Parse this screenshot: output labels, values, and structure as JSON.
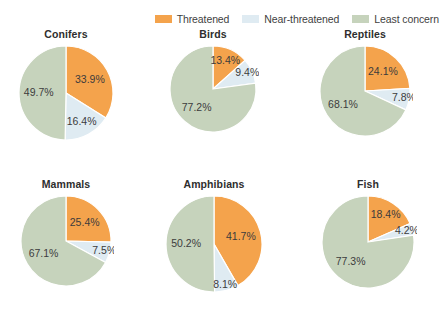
{
  "legend": {
    "items": [
      {
        "label": "Threatened",
        "color": "#F4A34C",
        "swatch_name": "legend-swatch-threatened"
      },
      {
        "label": "Near-threatened",
        "color": "#DFEBF2",
        "swatch_name": "legend-swatch-near-threatened"
      },
      {
        "label": "Least concern",
        "color": "#C6D3BC",
        "swatch_name": "legend-swatch-least-concern"
      }
    ]
  },
  "chart_data": {
    "type": "pie",
    "title": "",
    "legend_position": "top-right",
    "series_names": [
      "Threatened",
      "Near-threatened",
      "Least concern"
    ],
    "colors": [
      "#F4A34C",
      "#DFEBF2",
      "#C6D3BC"
    ],
    "unit": "%",
    "charts": [
      {
        "title": "Conifers",
        "categories": [
          "Threatened",
          "Near-threatened",
          "Least concern"
        ],
        "values": [
          33.9,
          16.4,
          49.7
        ],
        "labels": [
          "33.9%",
          "16.4%",
          "49.7%"
        ]
      },
      {
        "title": "Birds",
        "categories": [
          "Threatened",
          "Near-threatened",
          "Least concern"
        ],
        "values": [
          13.4,
          9.4,
          77.2
        ],
        "labels": [
          "13.4%",
          "9.4%",
          "77.2%"
        ]
      },
      {
        "title": "Reptiles",
        "categories": [
          "Threatened",
          "Near-threatened",
          "Least concern"
        ],
        "values": [
          24.1,
          7.8,
          68.1
        ],
        "labels": [
          "24.1%",
          "7.8%",
          "68.1%"
        ]
      },
      {
        "title": "Mammals",
        "categories": [
          "Threatened",
          "Near-threatened",
          "Least concern"
        ],
        "values": [
          25.4,
          7.5,
          67.1
        ],
        "labels": [
          "25.4%",
          "7.5%",
          "67.1%"
        ]
      },
      {
        "title": "Amphibians",
        "categories": [
          "Threatened",
          "Near-threatened",
          "Least concern"
        ],
        "values": [
          41.7,
          8.1,
          50.2
        ],
        "labels": [
          "41.7%",
          "8.1%",
          "50.2%"
        ]
      },
      {
        "title": "Fish",
        "categories": [
          "Threatened",
          "Near-threatened",
          "Least concern"
        ],
        "values": [
          18.4,
          4.2,
          77.3
        ],
        "labels": [
          "18.4%",
          "4.2%",
          "77.3%"
        ]
      }
    ]
  }
}
